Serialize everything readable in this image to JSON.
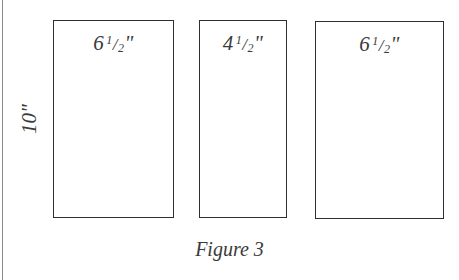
{
  "figure": {
    "caption": "Figure 3",
    "height_label": "10\"",
    "panels": [
      {
        "whole": "6",
        "num": "1",
        "den": "2",
        "unit": "\"",
        "width_in": 6.5,
        "height_in": 10
      },
      {
        "whole": "4",
        "num": "1",
        "den": "2",
        "unit": "\"",
        "width_in": 4.5,
        "height_in": 10
      },
      {
        "whole": "6",
        "num": "1",
        "den": "2",
        "unit": "\"",
        "width_in": 6.5,
        "height_in": 10
      }
    ],
    "colors": {
      "line": "#2e2e2e",
      "text": "#3a3a3a",
      "frame": "#8a8a8a",
      "background": "#ffffff"
    }
  }
}
